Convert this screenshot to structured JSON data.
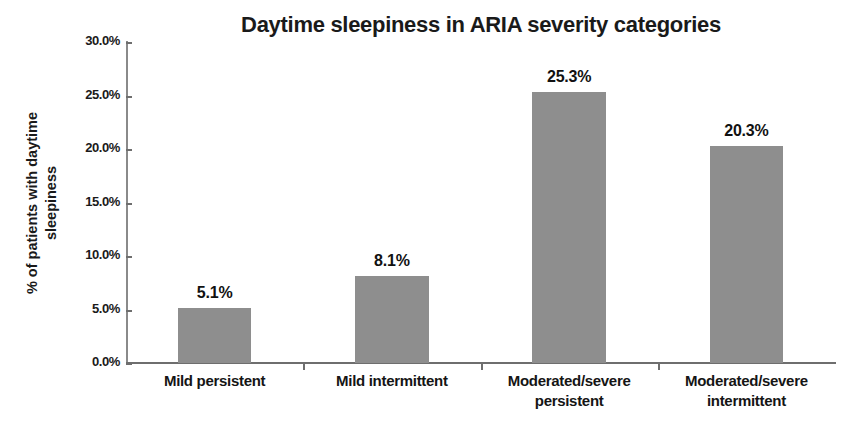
{
  "chart_data": {
    "type": "bar",
    "title": "Daytime sleepiness in ARIA severity categories",
    "xlabel": "",
    "ylabel_lines": [
      "% of patients with daytime",
      "sleepiness"
    ],
    "ylabel": "% of patients with daytime sleepiness",
    "categories": [
      "Mild persistent",
      "Mild intermittent",
      "Moderated/severe persistent",
      "Moderated/severe intermittent"
    ],
    "category_lines": [
      [
        "Mild persistent"
      ],
      [
        "Mild intermittent"
      ],
      [
        "Moderated/severe",
        "persistent"
      ],
      [
        "Moderated/severe",
        "intermittent"
      ]
    ],
    "values": [
      5.1,
      8.1,
      25.3,
      20.3
    ],
    "value_labels": [
      "5.1%",
      "8.1%",
      "25.3%",
      "20.3%"
    ],
    "ylim": [
      0,
      30
    ],
    "ytick_values": [
      0,
      5,
      10,
      15,
      20,
      25,
      30
    ],
    "ytick_labels": [
      "0.0%",
      "5.0%",
      "10.0%",
      "15.0%",
      "20.0%",
      "25.0%",
      "30.0%"
    ],
    "grid": false,
    "legend": false,
    "bar_color": "#8e8e8e",
    "axis_color": "#6e6e6e",
    "background_color": "#ffffff",
    "text_color": "#1a1a1a"
  }
}
